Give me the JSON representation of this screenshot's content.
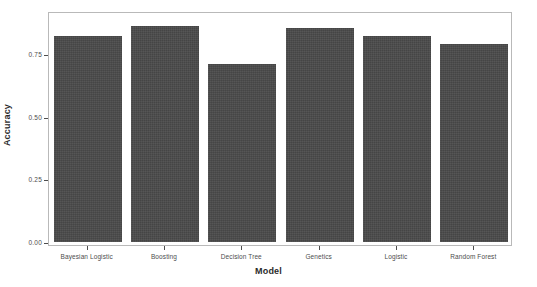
{
  "chart_data": {
    "type": "bar",
    "title": "",
    "subtitle": "",
    "xlabel": "Model",
    "ylabel": "Accuracy",
    "categories": [
      "Bayesian Logistic",
      "Boosting",
      "Decision Tree",
      "Genetics",
      "Logistic",
      "Random Forest"
    ],
    "values": [
      0.82,
      0.86,
      0.71,
      0.855,
      0.82,
      0.79
    ],
    "ylim": [
      0.0,
      0.9
    ],
    "yticks": [
      "0.00",
      "0.25",
      "0.50",
      "0.75"
    ],
    "ytick_values": [
      0.0,
      0.25,
      0.5,
      0.75
    ],
    "grid": false,
    "legend": null,
    "bar_color": "#4a4a4a",
    "panel_background": "#ffffff",
    "panel_border_color": "#b9b9b9",
    "axis_text_color": "#4d4d4d",
    "series": [
      {
        "name": "Accuracy",
        "values": [
          0.82,
          0.86,
          0.71,
          0.855,
          0.82,
          0.79
        ]
      }
    ]
  },
  "axes": {
    "x_title": "Model",
    "y_title": "Accuracy"
  },
  "ticks": {
    "y": [
      {
        "label": "0.00",
        "value": 0.0
      },
      {
        "label": "0.25",
        "value": 0.25
      },
      {
        "label": "0.50",
        "value": 0.5
      },
      {
        "label": "0.75",
        "value": 0.75
      }
    ],
    "x": [
      {
        "label": "Bayesian Logistic"
      },
      {
        "label": "Boosting"
      },
      {
        "label": "Decision Tree"
      },
      {
        "label": "Genetics"
      },
      {
        "label": "Logistic"
      },
      {
        "label": "Random Forest"
      }
    ]
  }
}
